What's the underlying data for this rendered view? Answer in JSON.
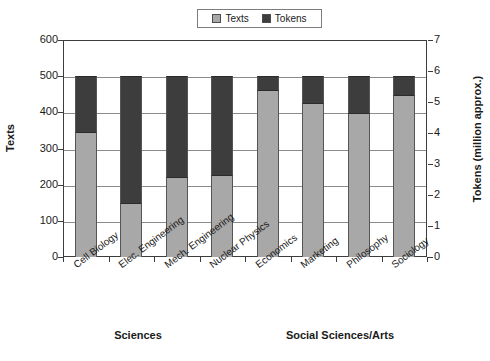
{
  "chart_data": {
    "type": "bar",
    "subtype": "stacked-column",
    "title": "",
    "categories": [
      "Cell Biology",
      "Elec. Engineering",
      "Mech. Engineering",
      "Nuclear Physics",
      "Economics",
      "Marketing",
      "Philosophy",
      "Sociology"
    ],
    "series": [
      {
        "name": "Texts",
        "axis": "left",
        "color": "#a8a8a8",
        "values": [
          345,
          148,
          222,
          228,
          462,
          425,
          398,
          448
        ]
      },
      {
        "name": "Tokens",
        "axis": "right",
        "color": "#3d3d3d",
        "values": [
          155,
          352,
          278,
          272,
          38,
          75,
          102,
          52
        ]
      }
    ],
    "stack_total": 500,
    "xlabel": "",
    "ylabel": "Texts",
    "ylabel_secondary": "Tokens (million approx.)",
    "ylim": [
      0,
      600
    ],
    "ylim_secondary": [
      0,
      7
    ],
    "yticks": [
      0,
      100,
      200,
      300,
      400,
      500,
      600
    ],
    "yticks_secondary": [
      0,
      1,
      2,
      3,
      4,
      5,
      6,
      7
    ],
    "grid": true,
    "legend_position": "top-center",
    "legend_entries": [
      "Texts",
      "Tokens"
    ],
    "group_labels": [
      "Sciences",
      "Social Sciences/Arts"
    ]
  },
  "axes": {
    "left": {
      "title": "Texts",
      "ticks": [
        "600",
        "500",
        "400",
        "300",
        "200",
        "100",
        "0"
      ]
    },
    "right": {
      "title": "Tokens (million approx.)",
      "ticks": [
        "7",
        "6",
        "5",
        "4",
        "3",
        "2",
        "1",
        "0"
      ]
    }
  },
  "legend": {
    "items": [
      {
        "label": "Texts",
        "color": "#a8a8a8"
      },
      {
        "label": "Tokens",
        "color": "#3d3d3d"
      }
    ]
  },
  "xaxis": {
    "labels": [
      "Cell Biology",
      "Elec. Engineering",
      "Mech. Engineering",
      "Nuclear Physics",
      "Economics",
      "Marketing",
      "Philosophy",
      "Sociology"
    ]
  },
  "groups": [
    {
      "label": "Sciences"
    },
    {
      "label": "Social Sciences/Arts"
    }
  ]
}
